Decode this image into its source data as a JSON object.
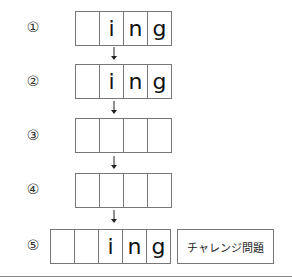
{
  "rows": [
    {
      "label": "①",
      "cells": [
        "",
        "i",
        "n",
        "g"
      ]
    },
    {
      "label": "②",
      "cells": [
        "",
        "i",
        "n",
        "g"
      ]
    },
    {
      "label": "③",
      "cells": [
        "",
        "",
        "",
        ""
      ]
    },
    {
      "label": "④",
      "cells": [
        "",
        "",
        "",
        ""
      ]
    },
    {
      "label": "⑤",
      "cells": [
        "",
        "",
        "i",
        "n",
        "g"
      ]
    }
  ],
  "challenge_label": "チャレンジ問題",
  "icons": {
    "arrow": "down-arrow-icon"
  }
}
